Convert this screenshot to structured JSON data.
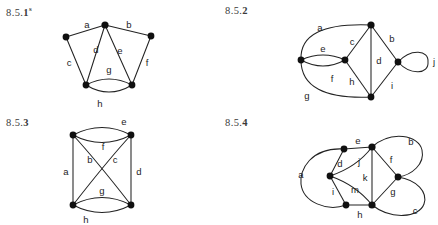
{
  "page": {
    "background": "#ffffff",
    "ink": "#232323",
    "vertex_color": "#101010",
    "label_color": "#1d1d1d"
  },
  "figures": [
    {
      "id": "fig-1",
      "caption_prefix": "8.5.",
      "caption_number": "1",
      "caption_superscript": "s",
      "caption_full": "8.5.1s",
      "edge_labels": [
        "a",
        "b",
        "c",
        "d",
        "e",
        "f",
        "g",
        "h"
      ],
      "vertex_count": 5,
      "edge_count": 8
    },
    {
      "id": "fig-2",
      "caption_prefix": "8.5.",
      "caption_number": "2",
      "caption_superscript": "",
      "caption_full": "8.5.2",
      "edge_labels": [
        "a",
        "b",
        "c",
        "d",
        "e",
        "f",
        "g",
        "h",
        "i",
        "j"
      ],
      "vertex_count": 5,
      "edge_count": 10
    },
    {
      "id": "fig-3",
      "caption_prefix": "8.5.",
      "caption_number": "3",
      "caption_superscript": "",
      "caption_full": "8.5.3",
      "edge_labels": [
        "a",
        "b",
        "c",
        "d",
        "e",
        "f",
        "g",
        "h"
      ],
      "vertex_count": 4,
      "edge_count": 8
    },
    {
      "id": "fig-4",
      "caption_prefix": "8.5.",
      "caption_number": "4",
      "caption_superscript": "",
      "caption_full": "8.5.4",
      "edge_labels": [
        "a",
        "b",
        "c",
        "d",
        "e",
        "f",
        "g",
        "h",
        "i",
        "j",
        "k",
        "m"
      ],
      "vertex_count": 6,
      "edge_count": 12
    }
  ],
  "fig1": {
    "labels": {
      "a": "a",
      "b": "b",
      "c": "c",
      "d": "d",
      "e": "e",
      "f": "f",
      "g": "g",
      "h": "h"
    }
  },
  "fig2": {
    "labels": {
      "a": "a",
      "b": "b",
      "c": "c",
      "d": "d",
      "e": "e",
      "f": "f",
      "g": "g",
      "h": "h",
      "i": "i",
      "j": "j"
    }
  },
  "fig3": {
    "labels": {
      "a": "a",
      "b": "b",
      "c": "c",
      "d": "d",
      "e": "e",
      "f": "f",
      "g": "g",
      "h": "h"
    }
  },
  "fig4": {
    "labels": {
      "a": "a",
      "b": "b",
      "c": "c",
      "d": "d",
      "e": "e",
      "f": "f",
      "g": "g",
      "h": "h",
      "i": "i",
      "j": "j",
      "k": "k",
      "m": "m"
    }
  }
}
